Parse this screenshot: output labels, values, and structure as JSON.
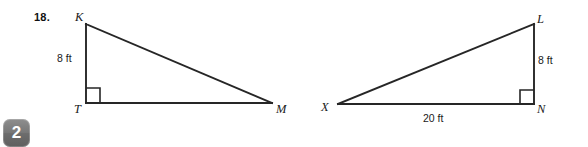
{
  "problem": {
    "number": "18."
  },
  "figures": [
    {
      "name": "triangle-KTM",
      "vertices": [
        {
          "label": "K",
          "x": 86,
          "y": 24
        },
        {
          "label": "T",
          "x": 86,
          "y": 103
        },
        {
          "label": "M",
          "x": 272,
          "y": 103
        }
      ],
      "right_angle_at": "T",
      "measures": [
        {
          "side": "KT",
          "text": "8 ft",
          "value": 8,
          "unit": "ft"
        }
      ]
    },
    {
      "name": "triangle-LXN",
      "vertices": [
        {
          "label": "L",
          "x": 534,
          "y": 24
        },
        {
          "label": "X",
          "x": 338,
          "y": 104
        },
        {
          "label": "N",
          "x": 534,
          "y": 104
        }
      ],
      "right_angle_at": "N",
      "measures": [
        {
          "side": "LN",
          "text": "8 ft",
          "value": 8,
          "unit": "ft"
        },
        {
          "side": "XN",
          "text": "20 ft",
          "value": 20,
          "unit": "ft"
        }
      ]
    }
  ],
  "labels": {
    "K": "K",
    "T": "T",
    "M": "M",
    "L": "L",
    "X": "X",
    "N": "N",
    "measure_KT": "8 ft",
    "measure_LN": "8 ft",
    "measure_XN": "20 ft"
  },
  "badge": {
    "glyph": "2"
  },
  "colors": {
    "background": "#ffffff",
    "ink": "#1a1a1a",
    "stroke": "#262626",
    "badge": "#767676"
  }
}
